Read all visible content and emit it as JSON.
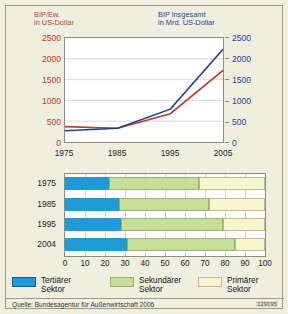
{
  "colors": {
    "background": "#efefe0",
    "plot_background": "#ffffff",
    "primary_red": "#c0392b",
    "primary_blue": "#1f3f8f",
    "tertiary_sector": "#1f9ad6",
    "secondary_sector": "#c7dd9a",
    "primary_sector": "#f7f5d0",
    "frame": "#9a9a86"
  },
  "line_chart": {
    "left_axis_caption": "BIP/Ew.\nin US-Dollar",
    "right_axis_caption": "BIP insgesamt\nin Mrd. US-Dollar",
    "y_ticks": [
      "2500",
      "2000",
      "1500",
      "1000",
      "500",
      "0"
    ],
    "y_ticks_right": [
      "2500",
      "2000",
      "1500",
      "1000",
      "500",
      "0"
    ],
    "x_ticks": [
      "1975",
      "1985",
      "1995",
      "2005"
    ]
  },
  "bar_chart": {
    "row_labels": [
      "1975",
      "1985",
      "1995",
      "2004"
    ],
    "x_ticks": [
      "0",
      "10",
      "20",
      "30",
      "40",
      "50",
      "60",
      "70",
      "80",
      "90",
      "100"
    ]
  },
  "legend": {
    "items": [
      {
        "label": "Tertiärer\nSektor",
        "color": "#1f9ad6",
        "name": "tertiaer"
      },
      {
        "label": "Sekundärer\nSektor",
        "color": "#c7dd9a",
        "name": "sekundaer"
      },
      {
        "label": "Primärer\nSektor",
        "color": "#f7f5d0",
        "name": "primaer"
      }
    ]
  },
  "source": {
    "text": "Quelle: Bundesagentur für Außenwirtschaft 2006",
    "code": "129095"
  },
  "chart_data": [
    {
      "type": "line",
      "title": "",
      "xlabel": "",
      "ylabel": "BIP/Ew. in US-Dollar",
      "ylabel_right": "BIP insgesamt in Mrd. US-Dollar",
      "x": [
        1975,
        1985,
        1995,
        2005
      ],
      "xlim": [
        1975,
        2005
      ],
      "ylim": [
        0,
        2500
      ],
      "ylim_right": [
        0,
        2500
      ],
      "grid": true,
      "legend_position": "none",
      "series": [
        {
          "name": "BIP/Ew. in US-Dollar",
          "color": "#c0392b",
          "axis": "left",
          "values": [
            370,
            330,
            680,
            1720
          ]
        },
        {
          "name": "BIP insgesamt in Mrd. US-Dollar",
          "color": "#1f3f8f",
          "axis": "right",
          "values": [
            270,
            330,
            790,
            2230
          ]
        }
      ]
    },
    {
      "type": "bar",
      "orientation": "horizontal",
      "stacked": true,
      "stacked_percent": true,
      "title": "",
      "xlabel": "",
      "ylabel": "",
      "xlim": [
        0,
        100
      ],
      "grid": true,
      "legend_position": "bottom",
      "categories": [
        "1975",
        "1985",
        "1995",
        "2004"
      ],
      "series": [
        {
          "name": "Tertiärer Sektor",
          "color": "#1f9ad6",
          "values": [
            22,
            27,
            28,
            31
          ]
        },
        {
          "name": "Sekundärer Sektor",
          "color": "#c7dd9a",
          "values": [
            45,
            45,
            51,
            54
          ]
        },
        {
          "name": "Primärer Sektor",
          "color": "#f7f5d0",
          "values": [
            33,
            28,
            21,
            15
          ]
        }
      ]
    }
  ]
}
